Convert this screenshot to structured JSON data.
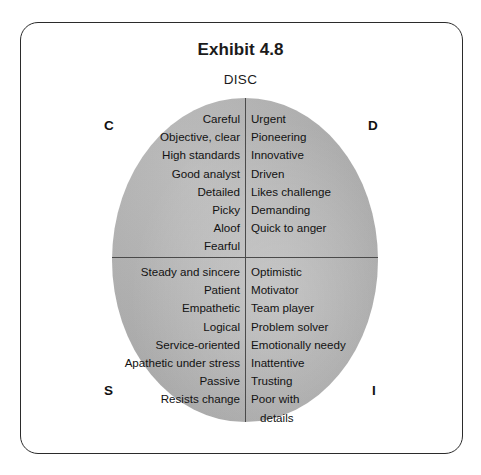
{
  "exhibit": {
    "title": "Exhibit 4.8",
    "subtitle": "DISC"
  },
  "quadrant_labels": {
    "c": "C",
    "d": "D",
    "s": "S",
    "i": "I"
  },
  "quadrants": {
    "c": {
      "label": "C",
      "position": "upper-left",
      "traits": [
        "Careful",
        "Objective, clear",
        "High standards",
        "Good analyst",
        "Detailed",
        "Picky",
        "Aloof",
        "Fearful"
      ]
    },
    "d": {
      "label": "D",
      "position": "upper-right",
      "traits": [
        "Urgent",
        "Pioneering",
        "Innovative",
        "Driven",
        "Likes challenge",
        "Demanding",
        "Quick to anger"
      ]
    },
    "s": {
      "label": "S",
      "position": "lower-left",
      "traits": [
        "Steady and sincere",
        "Patient",
        "Empathetic",
        "Logical",
        "Service-oriented",
        "Apathetic under stress",
        "Passive",
        "Resists change"
      ]
    },
    "i": {
      "label": "I",
      "position": "lower-right",
      "traits": [
        "Optimistic",
        "Motivator",
        "Team player",
        "Problem solver",
        "Emotionally needy",
        "Inattentive",
        "Trusting",
        "Poor with",
        "details"
      ]
    }
  },
  "colors": {
    "circle_fill": "#adadad",
    "divider": "#4a4a4a",
    "frame_border": "#2b2b2b",
    "text": "#121212",
    "page_background": "#ffffff"
  }
}
